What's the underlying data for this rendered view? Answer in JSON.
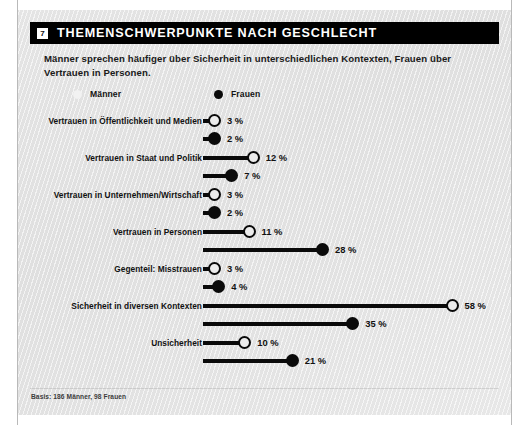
{
  "card": {
    "badge": "7",
    "title": "THEMENSCHWERPUNKTE NACH GESCHLECHT",
    "subtitle": "Männer sprechen häufiger über Sicherheit in unterschiedlichen Kontexten, Frauen über Vertrauen in Personen.",
    "footer": "Basis: 186 Männer, 98 Frauen"
  },
  "legend": {
    "maenner": {
      "label": "Männer",
      "marker": "hollow-circle",
      "color": "#0a0a0a"
    },
    "frauen": {
      "label": "Frauen",
      "marker": "filled-circle",
      "color": "#0a0a0a"
    }
  },
  "chart_data": {
    "type": "bar",
    "title": "THEMENSCHWERPUNKTE NACH GESCHLECHT",
    "subtitle": "Männer sprechen häufiger über Sicherheit in unterschiedlichen Kontexten, Frauen über Vertrauen in Personen.",
    "xlabel": "",
    "ylabel": "",
    "xlim": [
      0,
      58
    ],
    "grid": false,
    "legend_position": "top-left",
    "unit": "%",
    "categories": [
      "Vertrauen in Öffentlichkeit und Medien",
      "Vertrauen in Staat und Politik",
      "Vertrauen in Unternehmen/Wirtschaft",
      "Vertrauen in Personen",
      "Gegenteil: Misstrauen",
      "Sicherheit in diversen Kontexten",
      "Unsicherheit"
    ],
    "series": [
      {
        "name": "Männer",
        "marker": "hollow-circle",
        "values": [
          3,
          12,
          3,
          11,
          3,
          58,
          10
        ]
      },
      {
        "name": "Frauen",
        "marker": "filled-circle",
        "values": [
          2,
          7,
          2,
          28,
          4,
          35,
          21
        ]
      }
    ],
    "labels": {
      "maenner": [
        "3 %",
        "12 %",
        "3 %",
        "11 %",
        "3 %",
        "58 %",
        "10 %"
      ],
      "frauen": [
        "2 %",
        "7 %",
        "2 %",
        "28 %",
        "4 %",
        "35 %",
        "21 %"
      ]
    },
    "basis": "Basis: 186 Männer, 98 Frauen"
  }
}
